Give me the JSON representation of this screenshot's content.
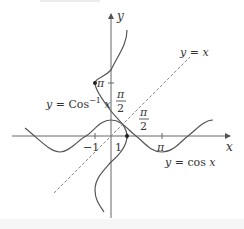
{
  "figure": {
    "colors": {
      "curve": "#555555",
      "axis": "#666666",
      "dashed_line": "#888888",
      "text": "#333333"
    },
    "axes": {
      "x_label": "x",
      "y_label": "y"
    },
    "x_ticks": [
      {
        "label": "−1",
        "value": -1
      },
      {
        "label": "1",
        "value": 1
      },
      {
        "label": "π",
        "value": 3.14159
      }
    ],
    "y_ticks": [
      {
        "label": "π",
        "value": 3.14159
      }
    ],
    "fractions": {
      "y_half_pi": {
        "num": "π",
        "den": "2"
      },
      "x_half_pi": {
        "num": "π",
        "den": "2"
      }
    },
    "curve_labels": {
      "arccos": {
        "prefix": "y = Cos",
        "sup": "−1",
        "suffix": " x"
      },
      "cos": "y = cos x",
      "identity": "y = x"
    },
    "points": [
      {
        "name": "pi-point",
        "x": -1,
        "y": 3.14159
      },
      {
        "name": "one-point",
        "x": 1,
        "y": 0
      }
    ]
  }
}
